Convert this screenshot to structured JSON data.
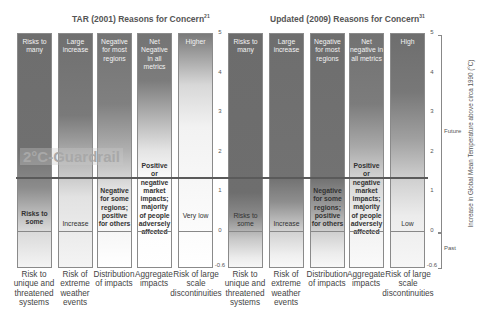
{
  "titles": {
    "tar": "TAR (2001) Reasons for Concern",
    "tar_ref": "21",
    "updated": "Updated (2009) Reasons for Concern",
    "updated_ref": "31"
  },
  "guardrail_label": "2°C-Guardrail",
  "y_axis": {
    "label": "Increase in Global Mean Temperature above circa 1990 (°C)",
    "ticks": [
      "5",
      "4",
      "3",
      "2",
      "1",
      "0",
      "-0.6"
    ],
    "future_label": "Future",
    "past_label": "Past"
  },
  "categories": [
    "Risk to unique and threatened systems",
    "Risk of extreme weather events",
    "Distribution of impacts",
    "Aggregate impacts",
    "Risk of large scale discontinuities"
  ],
  "tar": [
    {
      "top": "Risks to many",
      "low": "Risks to some"
    },
    {
      "top": "Large increase",
      "low": "Increase"
    },
    {
      "top": "Negative for most regions",
      "low": "Negative for some regions; positive for others"
    },
    {
      "top": "Net Negative in all metrics",
      "low": "Positive or negative market impacts; majority of people adversely affected"
    },
    {
      "top": "Higher",
      "low": "Very low"
    }
  ],
  "updated": [
    {
      "top": "Risks to many",
      "low": "Risks to some"
    },
    {
      "top": "Large increase",
      "low": "Increase"
    },
    {
      "top": "Negative for most regions",
      "low": "Negative for some regions; positive for others"
    },
    {
      "top": "Net negative in all metrics",
      "low": "Positive or negative market impacts; majority of people adversely affected"
    },
    {
      "top": "High",
      "low": "Low"
    }
  ],
  "colors": {
    "bar_dark": "#6e6e6e",
    "bar_light": "#f4f4f4",
    "guardrail_line": "#5a5a5a"
  }
}
